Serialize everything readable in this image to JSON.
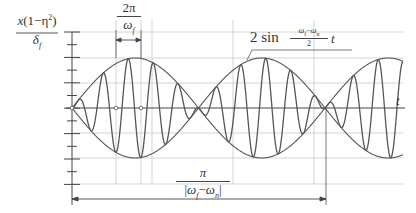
{
  "diagram": {
    "y_axis_label": {
      "numerator": "x(1−η²)",
      "denominator": "δ_f",
      "num_x": "x",
      "num_paren_open": "(1−η",
      "num_sup": "2",
      "num_paren_close": ")",
      "den_main": "δ",
      "den_sub": "f"
    },
    "x_axis_label": "t",
    "period_label": {
      "numerator": "2π",
      "denominator_main": "ω",
      "denominator_sub": "f"
    },
    "envelope_label": {
      "prefix": "2 sin",
      "numerator": "ω_f−ω_n",
      "num_a": "ω",
      "num_a_sub": "f",
      "num_minus": "−",
      "num_b": "ω",
      "num_b_sub": "n",
      "denominator": "2",
      "suffix": "t"
    },
    "beat_period_label": {
      "numerator": "π",
      "denominator": "|ω_f−ω_n|",
      "den_open": "|",
      "den_a": "ω",
      "den_a_sub": "f",
      "den_minus": "−",
      "den_b": "ω",
      "den_b_sub": "n",
      "den_close": "|"
    },
    "colors": {
      "curve": "#555555",
      "grid": "#c8c8c8",
      "axis": "#444444",
      "text": "#333333"
    },
    "geometry": {
      "origin_x": 72,
      "origin_y": 108,
      "amplitude_px": 50,
      "beat_half_period_px": 126.5,
      "carrier_period_px": 25,
      "x_end": 403
    }
  }
}
